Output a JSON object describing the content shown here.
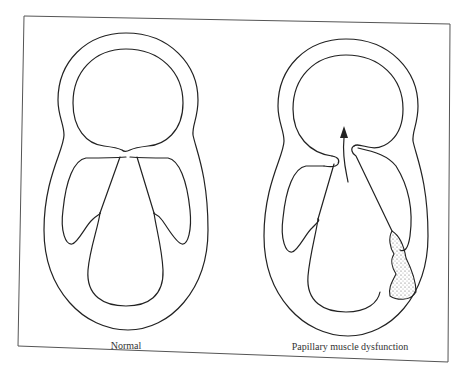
{
  "figure": {
    "panels": [
      {
        "id": "normal",
        "caption": "Normal"
      },
      {
        "id": "dysfunction",
        "caption": "Papillary muscle dysfunction"
      }
    ],
    "colors": {
      "line": "#222222",
      "frame": "#555555",
      "background": "#ffffff"
    }
  }
}
